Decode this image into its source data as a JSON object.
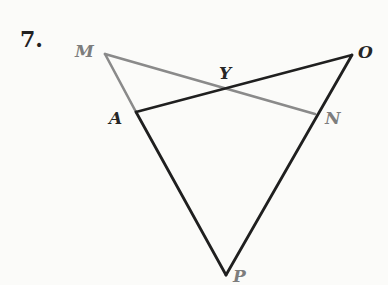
{
  "problem": {
    "number": "7."
  },
  "colors": {
    "dark_line": "#1f1f1f",
    "gray_line": "#8a8a8a",
    "dark_label": "#262626",
    "gray_label": "#7d7d7d"
  },
  "points": {
    "M": {
      "label": "M",
      "x": 105,
      "y": 54
    },
    "O": {
      "label": "O",
      "x": 352,
      "y": 55
    },
    "A": {
      "label": "A",
      "x": 136,
      "y": 112
    },
    "N": {
      "label": "N",
      "x": 315,
      "y": 114
    },
    "Y": {
      "label": "Y",
      "x": 225,
      "y": 87
    },
    "P": {
      "label": "P",
      "x": 226,
      "y": 275
    }
  },
  "segments": [
    {
      "from": "M",
      "to": "N",
      "style": "gray"
    },
    {
      "from": "M",
      "to": "A",
      "style": "gray"
    },
    {
      "from": "A",
      "to": "O",
      "style": "dark"
    },
    {
      "from": "A",
      "to": "P",
      "style": "dark"
    },
    {
      "from": "O",
      "to": "P",
      "style": "dark"
    }
  ]
}
